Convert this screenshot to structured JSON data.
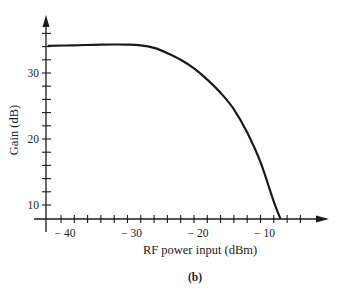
{
  "chart_data": {
    "type": "line",
    "title": "",
    "caption": "(b)",
    "xlabel": "RF power input (dBm)",
    "ylabel": "Gain (dB)",
    "xlim": [
      -44.5,
      -3
    ],
    "ylim": [
      7.9,
      40.5
    ],
    "x_ticks_major": [
      -40,
      -30,
      -20,
      -10
    ],
    "x_tick_labels": [
      "− 40",
      "− 30",
      "− 20",
      "− 10"
    ],
    "x_minor_step": 2,
    "y_ticks_major": [
      10,
      20,
      30
    ],
    "y_tick_labels": [
      "10",
      "20",
      "30"
    ],
    "y_minor_step": 2,
    "grid": false,
    "legend": null,
    "series": [
      {
        "name": "Gain",
        "x": [
          -42,
          -38,
          -34,
          -30,
          -28,
          -26,
          -24,
          -22,
          -20,
          -18,
          -16,
          -14,
          -12,
          -10,
          -8,
          -7
        ],
        "y": [
          34.1,
          34.2,
          34.3,
          34.3,
          34.2,
          33.8,
          33.0,
          32.0,
          30.7,
          29.0,
          27.0,
          24.5,
          21.0,
          16.5,
          10.5,
          7.9
        ]
      }
    ]
  }
}
